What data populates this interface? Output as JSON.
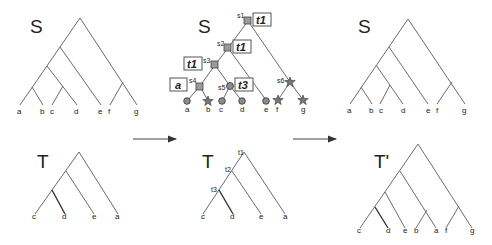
{
  "panels": {
    "species_tree_left": {
      "label": "S",
      "leaves": [
        "a",
        "b",
        "c",
        "d",
        "e",
        "f",
        "g"
      ]
    },
    "species_tree_mapped": {
      "label": "S",
      "leaves": [
        "a",
        "b",
        "c",
        "d",
        "e",
        "f",
        "g"
      ],
      "internal_nodes": [
        "s1",
        "s2",
        "s3",
        "s4",
        "s5",
        "s6"
      ],
      "boxes": [
        {
          "node": "s1",
          "text": "t1"
        },
        {
          "node": "s2",
          "text": "t1"
        },
        {
          "node": "s3",
          "text": "t1"
        },
        {
          "node": "s4",
          "text": "a"
        },
        {
          "node": "s5",
          "text": "t3"
        }
      ],
      "markers": {
        "squares": [
          "s1",
          "s2",
          "s3",
          "s4"
        ],
        "circles": [
          "s5",
          "a",
          "c",
          "d",
          "e"
        ],
        "stars": [
          "s6",
          "b",
          "f",
          "g"
        ]
      }
    },
    "species_tree_right": {
      "label": "S",
      "leaves": [
        "a",
        "b",
        "c",
        "d",
        "e",
        "f",
        "g"
      ]
    },
    "gene_tree_left": {
      "label": "T",
      "leaves": [
        "c",
        "d",
        "e",
        "a"
      ]
    },
    "gene_tree_labeled": {
      "label": "T",
      "leaves": [
        "c",
        "d",
        "e",
        "a"
      ],
      "internal_nodes": [
        "t1",
        "t2",
        "t3"
      ]
    },
    "gene_tree_result": {
      "label": "T'",
      "leaves": [
        "c",
        "d",
        "e",
        "b",
        "a",
        "f",
        "g"
      ]
    }
  },
  "arrows": [
    "arrow-left-to-middle",
    "arrow-middle-to-right"
  ]
}
